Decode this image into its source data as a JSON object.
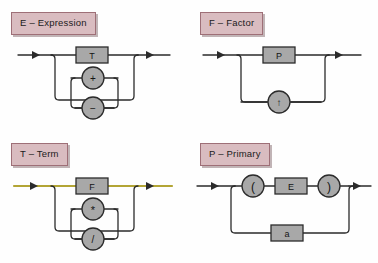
{
  "page": {
    "background_color": "#fefefe"
  },
  "style": {
    "label_fill": "#d9bcc0",
    "label_border": "#9e6f77",
    "node_fill": "#a8a8a8",
    "node_border": "#2b2b2b",
    "line_color": "#2b2b2b",
    "highlight_color": "#b3a535"
  },
  "diagrams": [
    {
      "id": "expression",
      "label": "E – Expression",
      "nonterminal": "E",
      "name": "Expression",
      "main_node": {
        "shape": "rect",
        "text": "T",
        "kind": "nonterminal"
      },
      "loop_nodes": [
        {
          "shape": "circle",
          "text": "+",
          "kind": "terminal"
        },
        {
          "shape": "circle",
          "text": "−",
          "kind": "terminal"
        }
      ],
      "highlighted": false,
      "rule": "E = T { (+ | −) T }"
    },
    {
      "id": "factor",
      "label": "F – Factor",
      "nonterminal": "F",
      "name": "Factor",
      "main_node": {
        "shape": "rect",
        "text": "P",
        "kind": "nonterminal"
      },
      "loop_nodes": [
        {
          "shape": "circle",
          "text": "↑",
          "kind": "terminal"
        }
      ],
      "highlighted": false,
      "rule": "F = P { ↑ P }"
    },
    {
      "id": "term",
      "label": "T – Term",
      "nonterminal": "T",
      "name": "Term",
      "main_node": {
        "shape": "rect",
        "text": "F",
        "kind": "nonterminal"
      },
      "loop_nodes": [
        {
          "shape": "circle",
          "text": "*",
          "kind": "terminal"
        },
        {
          "shape": "circle",
          "text": "/",
          "kind": "terminal"
        }
      ],
      "highlighted": true,
      "rule": "T = F { (* | /) F }"
    },
    {
      "id": "primary",
      "label": "P – Primary",
      "nonterminal": "P",
      "name": "Primary",
      "top_branch": [
        {
          "shape": "circle",
          "text": "(",
          "kind": "terminal"
        },
        {
          "shape": "rect",
          "text": "E",
          "kind": "nonterminal"
        },
        {
          "shape": "circle",
          "text": ")",
          "kind": "terminal"
        }
      ],
      "bottom_branch": [
        {
          "shape": "rect",
          "text": "a",
          "kind": "terminal"
        }
      ],
      "highlighted": false,
      "rule": "P = ( E ) | a"
    }
  ]
}
